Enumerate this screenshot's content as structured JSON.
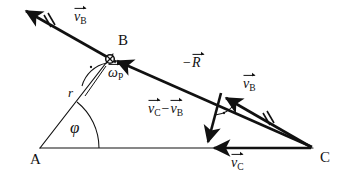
{
  "figure": {
    "type": "vector-kinematics-diagram",
    "background_color": "#ffffff",
    "line_color": "#111111"
  },
  "points": {
    "a": {
      "label": "A",
      "x": 40,
      "y": 148
    },
    "b": {
      "label": "B",
      "x": 110,
      "y": 59
    },
    "c": {
      "label": "C",
      "x": 312,
      "y": 148
    }
  },
  "labels": {
    "point_a": "A",
    "point_b": "B",
    "point_c": "C",
    "radius": "r",
    "angle_phi": "φ",
    "omega_p_symbol": "ω",
    "omega_p_sub": "P",
    "v_symbol": "v",
    "v_b_sub": "B",
    "v_c_sub": "C",
    "minus_sign": "−",
    "r_vector_symbol": "R"
  },
  "vectors": [
    {
      "name": "v_B_top",
      "text": "v⃗ B",
      "symbol": "v",
      "subscript": "B",
      "prefix": "",
      "label_x": 74,
      "label_y": 12,
      "from": [
        110,
        59
      ],
      "to": [
        22,
        9
      ],
      "style": "thick-arrow-with-double-tick",
      "tick": "double"
    },
    {
      "name": "neg_R",
      "text": "−R⃗",
      "symbol": "R",
      "subscript": "",
      "prefix": "−",
      "label_x": 188,
      "label_y": 58,
      "from": [
        312,
        148
      ],
      "to": [
        110,
        59
      ],
      "style": "thick-arrow",
      "tick": "none"
    },
    {
      "name": "v_B_right",
      "text": "v⃗ B",
      "symbol": "v",
      "subscript": "B",
      "prefix": "",
      "label_x": 245,
      "label_y": 79,
      "from": [
        312,
        148
      ],
      "to": [
        221,
        95
      ],
      "style": "thick-arrow-with-double-tick",
      "tick": "double"
    },
    {
      "name": "v_C_minus_v_B",
      "text": "v⃗ C − v⃗ B",
      "symbol": "v",
      "subscript": "C",
      "prefix": "",
      "label_x": 151,
      "label_y": 105,
      "from": [
        221,
        95
      ],
      "to": [
        207,
        147
      ],
      "style": "thick-arrow",
      "tick": "none"
    },
    {
      "name": "v_C",
      "text": "v⃗ C",
      "symbol": "v",
      "subscript": "C",
      "prefix": "",
      "label_x": 233,
      "label_y": 158,
      "from": [
        312,
        148
      ],
      "to": [
        208,
        148
      ],
      "style": "thick-arrow",
      "tick": "none"
    }
  ],
  "annotations": {
    "omega_p": {
      "text": "ω⃗ P",
      "x": 112,
      "y": 73
    },
    "radius_r": {
      "text": "r",
      "x": 70,
      "y": 93
    },
    "angle_phi": {
      "text": "φ",
      "x": 73,
      "y": 126
    },
    "right_angle_b": {
      "marker": "dot-in-arc",
      "x": 90,
      "y": 66
    },
    "right_angle_triangle": {
      "marker": "dot-in-arc",
      "x": 222,
      "y": 112
    },
    "pivot_b": {
      "marker": "circle-with-cross",
      "x": 110,
      "y": 59
    }
  }
}
